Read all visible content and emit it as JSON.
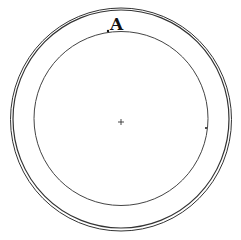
{
  "diagram": {
    "type": "concentric-circles",
    "label_point": "A",
    "center_marker": "+",
    "outer_ring": {
      "cx": 121,
      "cy": 119,
      "r": 109,
      "double": true
    },
    "inner_circle": {
      "cx": 121,
      "cy": 119,
      "r": 88
    },
    "stroke_color": "#333333",
    "marker_on_right": "."
  }
}
